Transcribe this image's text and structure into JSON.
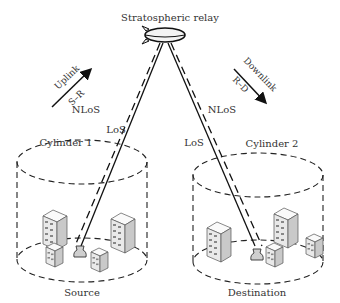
{
  "diagram": {
    "title": "Stratospheric relay",
    "uplink": {
      "label": "Uplink",
      "sublabel": "S–R"
    },
    "downlink": {
      "label": "Downlink",
      "sublabel": "R–D"
    },
    "left_links": {
      "nlos": "NLoS",
      "los": "LoS"
    },
    "right_links": {
      "nlos": "NLoS",
      "los": "LoS"
    },
    "cylinder1": {
      "label": "Cylinder 1",
      "node": "Source"
    },
    "cylinder2": {
      "label": "Cylinder 2",
      "node": "Destination"
    },
    "colors": {
      "line": "#111111",
      "text": "#333333",
      "building_fill": "#f2f2f2",
      "building_shade": "#d0d0d0"
    }
  }
}
